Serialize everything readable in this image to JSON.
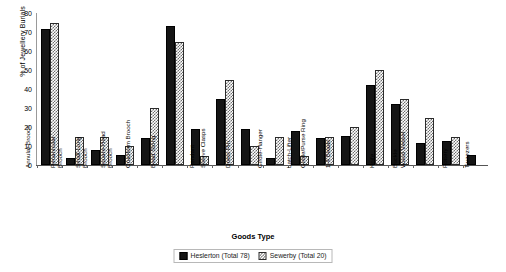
{
  "chart_data": {
    "type": "bar",
    "title": "",
    "xlabel": "Goods Type",
    "ylabel": "% of Jewellery Burials",
    "ylim": [
      0,
      80
    ],
    "yticks": [
      0,
      10,
      20,
      30,
      40,
      50,
      60,
      70,
      80
    ],
    "grid": false,
    "legend_position": "bottom",
    "categories": [
      "Annular Brooch",
      "Penannular Brooch",
      "Small-Long Brooch",
      "Square-Head Brooch",
      "Cruciform Brooch",
      "Bead String",
      "Pendant",
      "Sleeve Clasps",
      "Dress Pin",
      "Girdle-Hanger",
      "Latch-Lifter",
      "Girdle/Purse Ring",
      "1-4 Beads",
      "Knife",
      "Buckle",
      "Wood Vessel",
      "Pottery",
      "Tweezers"
    ],
    "series": [
      {
        "name": "Heslerton (Total 78)",
        "color": "#151515",
        "values": [
          71.8,
          3.8,
          7.7,
          5.1,
          14.1,
          73.1,
          19.2,
          34.6,
          19.2,
          3.8,
          17.9,
          14.1,
          15.4,
          42.3,
          32.1,
          11.5,
          12.8,
          5.1
        ]
      },
      {
        "name": "Sewerby (Total 20)",
        "color": "#6e6e6e",
        "values": [
          75.0,
          15.0,
          15.0,
          10.0,
          30.0,
          65.0,
          5.0,
          45.0,
          10.0,
          15.0,
          5.0,
          15.0,
          20.0,
          50.0,
          35.0,
          25.0,
          15.0,
          0.0
        ]
      }
    ]
  },
  "legend": {
    "items": [
      {
        "label": "Heslerton (Total 78)"
      },
      {
        "label": "Sewerby (Total 20)"
      }
    ]
  }
}
